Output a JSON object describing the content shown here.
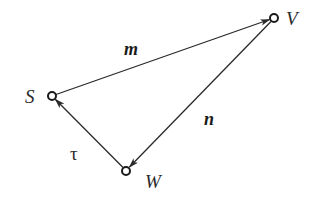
{
  "diagram": {
    "type": "directed-graph",
    "nodes": [
      {
        "id": "S",
        "label": "S",
        "x": 52,
        "y": 96
      },
      {
        "id": "V",
        "label": "V",
        "x": 274,
        "y": 18
      },
      {
        "id": "W",
        "label": "W",
        "x": 126,
        "y": 171
      }
    ],
    "edges": [
      {
        "from": "S",
        "to": "V",
        "label": "m"
      },
      {
        "from": "V",
        "to": "W",
        "label": "n"
      },
      {
        "from": "W",
        "to": "S",
        "label": "τ"
      }
    ],
    "colors": {
      "stroke": "#2a2a2a",
      "background": "#ffffff"
    }
  }
}
